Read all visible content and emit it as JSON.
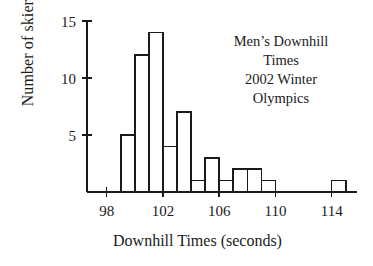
{
  "chart_data": {
    "type": "bar",
    "title": "",
    "xlabel": "Downhill Times (seconds)",
    "ylabel": "Number of skiers",
    "xlim": [
      96.6,
      115.8
    ],
    "ylim": [
      0,
      15.6
    ],
    "grid": false,
    "legend": null,
    "bin_width": 1,
    "bin_starts": [
      99,
      100,
      101,
      102,
      103,
      104,
      105,
      106,
      107,
      108,
      109,
      114
    ],
    "bin_labels": [
      "99-100",
      "100-101",
      "101-102",
      "102-103",
      "103-104",
      "104-105",
      "105-106",
      "106-107",
      "107-108",
      "108-109",
      "109-110",
      "114-115"
    ],
    "values": [
      5,
      12,
      14,
      4,
      7,
      1,
      3,
      1,
      2,
      2,
      1,
      1
    ],
    "xticks": [
      98,
      102,
      106,
      110,
      114
    ],
    "xtick_labels": [
      "98",
      "102",
      "106",
      "110",
      "114"
    ],
    "yticks": [
      5,
      10,
      15
    ],
    "ytick_labels": [
      "5",
      "10",
      "15"
    ]
  },
  "annotation": {
    "line1": "Men’s Downhill",
    "line2": "Times",
    "line3": "2002 Winter",
    "line4": "Olympics"
  },
  "axes": {
    "xlabel": "Downhill Times (seconds)",
    "ylabel": "Number of skiers"
  },
  "style": {
    "ink": "#1a1a1a",
    "background": "#ffffff",
    "bar_fill": "#ffffff",
    "bar_stroke": "#1a1a1a"
  }
}
